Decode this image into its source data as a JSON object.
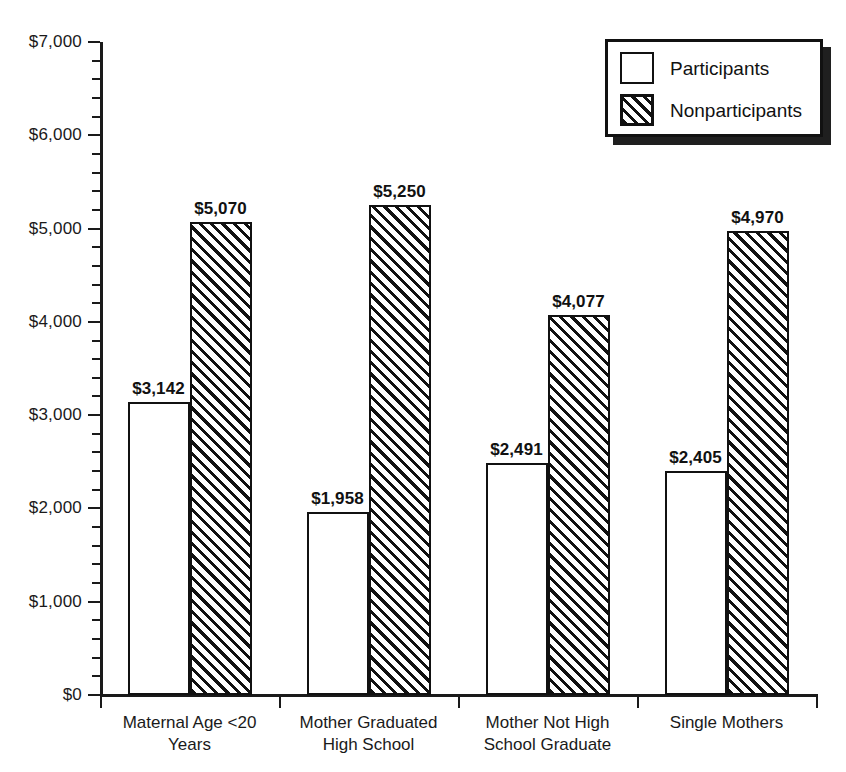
{
  "chart_data": {
    "type": "bar",
    "title": "",
    "subtitle": "",
    "xlabel": "",
    "ylabel": "",
    "grid": false,
    "legend_position": "top-right",
    "ylim": [
      0,
      7000
    ],
    "y_tick_step": 1000,
    "y_minor_step": 200,
    "y_tick_labels": [
      "$0",
      "$1,000",
      "$2,000",
      "$3,000",
      "$4,000",
      "$5,000",
      "$6,000",
      "$7,000"
    ],
    "y_tick_values": [
      0,
      1000,
      2000,
      3000,
      4000,
      5000,
      6000,
      7000
    ],
    "categories": [
      "Maternal Age <20 Years",
      "Mother Graduated High School",
      "Mother Not High School Graduate",
      "Single Mothers"
    ],
    "category_lines": [
      [
        "Maternal Age <20",
        "Years"
      ],
      [
        "Mother Graduated",
        "High School"
      ],
      [
        "Mother Not High",
        "School Graduate"
      ],
      [
        "Single Mothers",
        ""
      ]
    ],
    "series": [
      {
        "name": "Participants",
        "pattern": "solid-white",
        "values": [
          3142,
          1958,
          2491,
          2405
        ],
        "value_labels": [
          "$3,142",
          "$1,958",
          "$2,491",
          "$2,405"
        ]
      },
      {
        "name": "Nonparticipants",
        "pattern": "diagonal-hatch",
        "values": [
          5070,
          5250,
          4077,
          4970
        ],
        "value_labels": [
          "$5,070",
          "$5,250",
          "$4,077",
          "$4,970"
        ]
      }
    ]
  },
  "legend": {
    "entries": [
      {
        "label": "Participants",
        "pattern": "solid-white"
      },
      {
        "label": "Nonparticipants",
        "pattern": "diagonal-hatch"
      }
    ]
  },
  "colors": {
    "ink": "#111111",
    "axis": "#1a1a1a",
    "background": "#ffffff",
    "hatch": "#111111"
  }
}
